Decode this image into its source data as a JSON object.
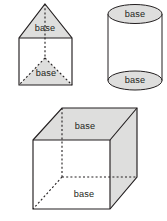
{
  "figure": {
    "background_color": "#ffffff",
    "face_fill_color": "#dededd",
    "edge_color": "#231f20",
    "label_text": "base",
    "shapes": [
      {
        "id": "triangular-prism",
        "name": "triangular prism",
        "position": "top-left",
        "labels": [
          {
            "text": "base",
            "location": "front triangular face",
            "x": 45,
            "y": 28
          },
          {
            "text": "base",
            "location": "rear triangular face (hidden)",
            "x": 46,
            "y": 73
          }
        ]
      },
      {
        "id": "cylinder",
        "name": "cylinder",
        "position": "top-right",
        "labels": [
          {
            "text": "base",
            "location": "top circular face",
            "x": 135,
            "y": 14
          },
          {
            "text": "base",
            "location": "bottom circular face",
            "x": 135,
            "y": 81
          }
        ]
      },
      {
        "id": "rectangular-prism",
        "name": "rectangular prism (cube)",
        "position": "bottom",
        "labels": [
          {
            "text": "base",
            "location": "top rectangular face",
            "x": 85,
            "y": 126
          },
          {
            "text": "base",
            "location": "bottom rectangular face (hidden)",
            "x": 84,
            "y": 194
          }
        ]
      }
    ]
  }
}
